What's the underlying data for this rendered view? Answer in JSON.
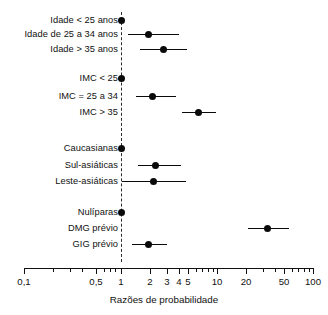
{
  "chart_data": {
    "type": "scatter",
    "title": "",
    "xlabel": "Razões de probabilidade",
    "ylabel": "",
    "xscale": "log",
    "xlim": [
      0.1,
      100
    ],
    "grid": false,
    "legend": null,
    "reference_line": 1,
    "axis_ticks": [
      {
        "value": 0.1,
        "label": "0,1"
      },
      {
        "value": 0.5,
        "label": "0,5"
      },
      {
        "value": 1,
        "label": "1"
      },
      {
        "value": 2,
        "label": "2"
      },
      {
        "value": 3,
        "label": "3"
      },
      {
        "value": 4,
        "label": "4"
      },
      {
        "value": 5,
        "label": "5"
      },
      {
        "value": 10,
        "label": "10"
      },
      {
        "value": 20,
        "label": "20"
      },
      {
        "value": 50,
        "label": "50"
      },
      {
        "value": 100,
        "label": "100"
      }
    ],
    "minor_ticks": [
      0.2,
      0.3,
      0.4,
      0.6,
      0.7,
      0.8,
      0.9,
      6,
      7,
      8,
      9,
      30,
      40,
      60,
      70,
      80,
      90
    ],
    "groups": [
      {
        "name": "Idade",
        "rows": [
          {
            "label": "Idade < 25 anos",
            "or": 1.0,
            "low": 1.0,
            "high": 1.0,
            "reference": true
          },
          {
            "label": "Idade de 25 a 34 anos",
            "or": 1.9,
            "low": 1.2,
            "high": 3.6,
            "reference": false
          },
          {
            "label": "Idade > 35 anos",
            "or": 2.6,
            "low": 1.5,
            "high": 4.4,
            "reference": false
          }
        ]
      },
      {
        "name": "IMC",
        "rows": [
          {
            "label": "IMC < 25",
            "or": 1.0,
            "low": 1.0,
            "high": 1.0,
            "reference": true
          },
          {
            "label": "IMC = 25 a 34",
            "or": 2.1,
            "low": 1.4,
            "high": 3.4,
            "reference": false
          },
          {
            "label": "IMC > 35",
            "or": 5.0,
            "low": 3.7,
            "high": 7.5,
            "reference": false
          }
        ]
      },
      {
        "name": "Etnia",
        "rows": [
          {
            "label": "Caucasianas",
            "or": 1.0,
            "low": 1.0,
            "high": 1.0,
            "reference": true
          },
          {
            "label": "Sul-asiáticas",
            "or": 2.3,
            "low": 1.5,
            "high": 3.9,
            "reference": false
          },
          {
            "label": "Leste-asiáticas",
            "or": 2.2,
            "low": 1.0,
            "high": 4.4,
            "reference": false
          }
        ]
      },
      {
        "name": "História obstétrica",
        "rows": [
          {
            "label": "Nulíparas",
            "or": 1.0,
            "low": 1.0,
            "high": 1.0,
            "reference": true
          },
          {
            "label": "DMG prévio",
            "or": 38.0,
            "low": 22.0,
            "high": 70.0,
            "reference": false
          },
          {
            "label": "GIG prévio",
            "or": 1.9,
            "low": 1.3,
            "high": 2.9,
            "reference": false
          }
        ]
      }
    ]
  },
  "layout": {
    "rows_px": [
      {
        "key": "idade-menor-25",
        "y": 20,
        "label_right": 118,
        "ci_left": 121,
        "ci_right": 121,
        "dot_x": 121
      },
      {
        "key": "idade-25-34",
        "y": 34,
        "label_right": 118,
        "ci_left": 128,
        "ci_right": 179,
        "dot_x": 148
      },
      {
        "key": "idade-maior-35",
        "y": 49,
        "label_right": 118,
        "ci_left": 140,
        "ci_right": 187,
        "dot_x": 163
      },
      {
        "key": "imc-menor-25",
        "y": 78,
        "label_right": 118,
        "ci_left": 121,
        "ci_right": 121,
        "dot_x": 121
      },
      {
        "key": "imc-25-34",
        "y": 96,
        "label_right": 118,
        "ci_left": 136,
        "ci_right": 176,
        "dot_x": 152
      },
      {
        "key": "imc-maior-35",
        "y": 112,
        "label_right": 118,
        "ci_left": 182,
        "ci_right": 216,
        "dot_x": 198
      },
      {
        "key": "caucasianas",
        "y": 148,
        "label_right": 118,
        "ci_left": 121,
        "ci_right": 121,
        "dot_x": 121
      },
      {
        "key": "sul-asiaticas",
        "y": 165,
        "label_right": 118,
        "ci_left": 138,
        "ci_right": 181,
        "dot_x": 155
      },
      {
        "key": "leste-asiaticas",
        "y": 181,
        "label_right": 118,
        "ci_left": 122,
        "ci_right": 186,
        "dot_x": 153
      },
      {
        "key": "nuliparas",
        "y": 212,
        "label_right": 118,
        "ci_left": 121,
        "ci_right": 121,
        "dot_x": 121
      },
      {
        "key": "dmg-previo",
        "y": 228,
        "label_right": 118,
        "ci_left": 248,
        "ci_right": 289,
        "dot_x": 267
      },
      {
        "key": "gig-previo",
        "y": 244,
        "label_right": 118,
        "ci_left": 132,
        "ci_right": 167,
        "dot_x": 148
      }
    ],
    "axis": {
      "left": 24,
      "right": 313,
      "y": 268,
      "zero_x": 121,
      "zero_top": 12,
      "zero_bottom": 262
    },
    "major_ticks_px": [
      {
        "x": 24,
        "label": "0,1",
        "h": 6
      },
      {
        "x": 96,
        "label": "0,5",
        "h": 6
      },
      {
        "x": 121,
        "label": "1",
        "h": 6
      },
      {
        "x": 150,
        "label": "2",
        "h": 6
      },
      {
        "x": 167,
        "label": "3",
        "h": 6
      },
      {
        "x": 179,
        "label": "4",
        "h": 6
      },
      {
        "x": 188,
        "label": "5",
        "h": 6
      },
      {
        "x": 217,
        "label": "10",
        "h": 6
      },
      {
        "x": 246,
        "label": "20",
        "h": 6
      },
      {
        "x": 284,
        "label": "50",
        "h": 6
      },
      {
        "x": 313,
        "label": "100",
        "h": 6
      }
    ],
    "minor_ticks_px": [
      {
        "x": 53,
        "h": 3.5
      },
      {
        "x": 70,
        "h": 3.5
      },
      {
        "x": 82,
        "h": 3.5
      },
      {
        "x": 104,
        "h": 3.5
      },
      {
        "x": 110,
        "h": 3.5
      },
      {
        "x": 115,
        "h": 3.5
      },
      {
        "x": 196,
        "h": 3.5
      },
      {
        "x": 202,
        "h": 3.5
      },
      {
        "x": 208,
        "h": 3.5
      },
      {
        "x": 213,
        "h": 3.5
      },
      {
        "x": 263,
        "h": 3.5
      },
      {
        "x": 275,
        "h": 3.5
      },
      {
        "x": 292,
        "h": 3.5
      },
      {
        "x": 298,
        "h": 3.5
      },
      {
        "x": 304,
        "h": 3.5
      },
      {
        "x": 309,
        "h": 3.5
      }
    ]
  }
}
